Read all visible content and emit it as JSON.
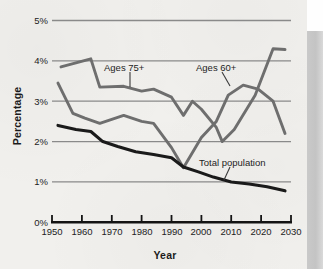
{
  "figure": {
    "background_color": "#f1f0ed",
    "page_edge_color": "#c6c6c6"
  },
  "axes": {
    "y_title": "Percentage",
    "x_title": "Year",
    "y_tick_labels": [
      "5%",
      "4%",
      "3%",
      "2%",
      "1%",
      "0%"
    ],
    "x_tick_labels": [
      "1950",
      "1960",
      "1970",
      "1980",
      "1990",
      "2000",
      "2010",
      "2020",
      "2030"
    ]
  },
  "series_labels": {
    "ages_75": "Ages 75+",
    "ages_60": "Ages 60+",
    "total_population": "Total population"
  },
  "colors": {
    "ages_75_line": "#6e6e6e",
    "ages_60_line": "#6e6e6e",
    "total_population_line": "#1a1a1a",
    "gridline": "#8a8a8a",
    "axis": "#141414"
  },
  "chart_data": {
    "type": "line",
    "title": "",
    "subtitle": "",
    "xlabel": "Year",
    "ylabel": "Percentage",
    "xlim": [
      1950,
      2030
    ],
    "ylim": [
      0,
      5
    ],
    "y_unit": "percent",
    "y_tick_values": [
      0,
      1,
      2,
      3,
      4,
      5
    ],
    "x_tick_values": [
      1950,
      1960,
      1970,
      1980,
      1990,
      2000,
      2010,
      2020,
      2030
    ],
    "grid": "horizontal",
    "legend_position": "inline-annotations",
    "annotations": [
      {
        "text": "Ages 75+",
        "series": "Ages 75+",
        "x": 1972,
        "y": 3.72
      },
      {
        "text": "Ages 60+",
        "series": "Ages 60+",
        "x": 2004,
        "y": 3.72
      },
      {
        "text": "Total population",
        "series": "Total population",
        "x": 2010,
        "y": 1.48
      }
    ],
    "series": [
      {
        "name": "Ages 75+",
        "color": "#6e6e6e",
        "x": [
          1953,
          1958,
          1963,
          1966,
          1974,
          1980,
          1984,
          1990,
          1994,
          1997,
          2000,
          2005,
          2007,
          2011,
          2018,
          2024,
          2028
        ],
        "values": [
          3.85,
          3.95,
          4.05,
          3.35,
          3.37,
          3.25,
          3.3,
          3.1,
          2.65,
          3.0,
          2.8,
          2.35,
          2.0,
          2.3,
          3.15,
          4.3,
          4.28
        ]
      },
      {
        "name": "Ages 60+",
        "color": "#6e6e6e",
        "x": [
          1952,
          1957,
          1961,
          1966,
          1974,
          1980,
          1984,
          1990,
          1994,
          2000,
          2005,
          2009,
          2014,
          2019,
          2024,
          2028
        ],
        "values": [
          3.45,
          2.7,
          2.58,
          2.45,
          2.65,
          2.5,
          2.45,
          1.85,
          1.35,
          2.1,
          2.5,
          3.15,
          3.4,
          3.3,
          3.0,
          2.2
        ]
      },
      {
        "name": "Total population",
        "color": "#1a1a1a",
        "x": [
          1952,
          1958,
          1963,
          1967,
          1972,
          1978,
          1984,
          1990,
          1994,
          1999,
          2004,
          2010,
          2016,
          2022,
          2028
        ],
        "values": [
          2.4,
          2.3,
          2.25,
          2.0,
          1.88,
          1.75,
          1.68,
          1.6,
          1.37,
          1.25,
          1.12,
          1.0,
          0.95,
          0.88,
          0.78
        ]
      }
    ]
  }
}
